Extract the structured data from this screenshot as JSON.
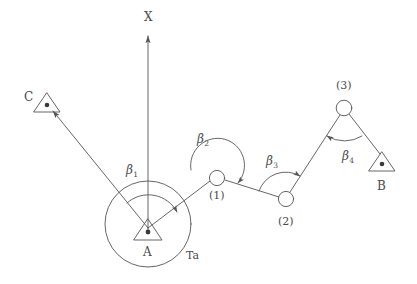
{
  "figure": {
    "type": "kinematic-chain-diagram",
    "stroke_color": "#555555",
    "text_color": "#4a4a4a",
    "background": "#ffffff",
    "width": 417,
    "height": 284
  },
  "axis": {
    "name": "x-axis",
    "label": "X",
    "label_x": 144,
    "label_y": 11,
    "from": [
      148,
      230
    ],
    "to": [
      148,
      33
    ],
    "arrow": "up"
  },
  "nodes": [
    {
      "id": "A",
      "label": "A",
      "shape": "triangle-with-dot",
      "x": 148,
      "y": 230,
      "label_x": 143,
      "label_y": 246,
      "size": 14
    },
    {
      "id": "C",
      "label": "C",
      "shape": "triangle-with-dot",
      "x": 47,
      "y": 104,
      "label_x": 24,
      "label_y": 91,
      "size": 13
    },
    {
      "id": "B",
      "label": "B",
      "shape": "triangle-with-dot",
      "x": 382,
      "y": 163,
      "label_x": 377,
      "label_y": 180,
      "size": 13
    },
    {
      "id": "J1",
      "label": "(1)",
      "shape": "circle",
      "x": 217,
      "y": 178,
      "label_x": 209,
      "label_y": 190,
      "radius": 8
    },
    {
      "id": "J2",
      "label": "(2)",
      "shape": "circle",
      "x": 286,
      "y": 199,
      "label_x": 278,
      "label_y": 216,
      "radius": 8
    },
    {
      "id": "J3",
      "label": "(3)",
      "shape": "circle",
      "x": 344,
      "y": 108,
      "label_x": 336,
      "label_y": 80,
      "radius": 8
    }
  ],
  "links": [
    {
      "name": "link-A-C",
      "from": "A",
      "to": "C",
      "arrow": "to-C"
    },
    {
      "name": "link-A-J1",
      "from": "A",
      "to": "J1",
      "arrow": "none"
    },
    {
      "name": "link-J1-J2",
      "from": "J1",
      "to": "J2",
      "arrow": "none"
    },
    {
      "name": "link-J2-J3",
      "from": "J2",
      "to": "J3",
      "arrow": "none"
    },
    {
      "name": "link-J3-B",
      "from": "J3",
      "to": "B",
      "arrow": "none"
    }
  ],
  "circle_Ta": {
    "name": "Ta-circle",
    "label": "Ta",
    "center": [
      148,
      224
    ],
    "radius": 43,
    "label_x": 186,
    "label_y": 250
  },
  "angles": [
    {
      "id": "beta1",
      "label": "β",
      "subscript": "1",
      "at_node": "A",
      "label_x": 126,
      "label_y": 164,
      "arc_radius": 32,
      "from_deg": 131,
      "to_deg": 28,
      "arrow_at": "end"
    },
    {
      "id": "beta2",
      "label": "β",
      "subscript": "2",
      "at_node": "J1",
      "label_x": 197,
      "label_y": 133,
      "arc_radius": 27,
      "from_deg": 196,
      "to_deg": 343,
      "arrow_at": "end"
    },
    {
      "id": "beta3",
      "label": "β",
      "subscript": "3",
      "at_node": "J2",
      "label_x": 266,
      "label_y": 155,
      "arc_radius": 28,
      "from_deg": 163,
      "to_deg": 302,
      "arrow_at": "end"
    },
    {
      "id": "beta4",
      "label": "β",
      "subscript": "4",
      "at_node": "J3",
      "label_x": 342,
      "label_y": 150,
      "arc_radius": 33,
      "from_deg": 57,
      "to_deg": 122,
      "arrow_at": "end"
    }
  ]
}
